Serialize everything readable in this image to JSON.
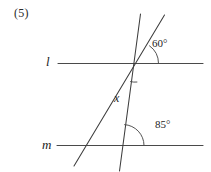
{
  "problem": {
    "number_label": "(5)"
  },
  "figure": {
    "type": "geometry-diagram",
    "stroke_color": "#4a4a4a",
    "background_color": "#ffffff",
    "labels": {
      "line_l": "l",
      "line_m": "m",
      "unknown_angle": "x",
      "angle_top": "60°",
      "angle_bottom": "85°"
    },
    "angles": [
      {
        "name": "angle-60",
        "value": "60°",
        "location": "above line l, right of intersection, between upper transversal and line l"
      },
      {
        "name": "angle-x",
        "value": "x",
        "location": "below line l, between the two transversals"
      },
      {
        "name": "angle-85",
        "value": "85°",
        "location": "above line m, right of intersection, between steep transversal and line m"
      }
    ],
    "elements": [
      {
        "name": "line-l",
        "kind": "horizontal-line"
      },
      {
        "name": "line-m",
        "kind": "horizontal-line"
      },
      {
        "name": "transversal-left",
        "kind": "transversal-line"
      },
      {
        "name": "transversal-right",
        "kind": "transversal-line"
      }
    ]
  }
}
